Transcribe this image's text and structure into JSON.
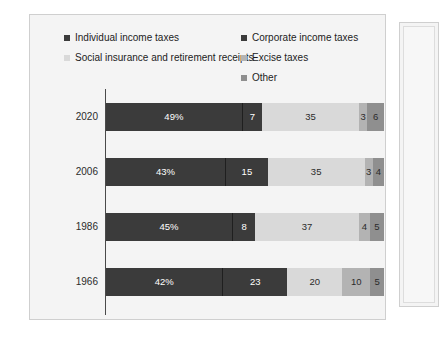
{
  "chart_data": {
    "type": "bar",
    "orientation": "horizontal",
    "stacked": true,
    "title": "",
    "xlabel": "",
    "ylabel": "",
    "categories": [
      "2020",
      "2006",
      "1986",
      "1966"
    ],
    "series": [
      {
        "name": "Individual income taxes",
        "color": "#3b3b3b",
        "label_color": "#ffffff",
        "values": [
          49,
          43,
          45,
          42
        ],
        "labels": [
          "49%",
          "43%",
          "45%",
          "42%"
        ]
      },
      {
        "name": "Corporate income taxes",
        "color": "#3b3b3b",
        "label_color": "#ffffff",
        "values": [
          7,
          15,
          8,
          23
        ],
        "labels": [
          "7",
          "15",
          "8",
          "23"
        ]
      },
      {
        "name": "Social insurance and retirement receipts",
        "color": "#d9d9d9",
        "label_color": "#2b2b2b",
        "values": [
          35,
          35,
          37,
          20
        ],
        "labels": [
          "35",
          "35",
          "37",
          "20"
        ]
      },
      {
        "name": "Excise taxes",
        "color": "#b3b3b3",
        "label_color": "#2b2b2b",
        "values": [
          3,
          3,
          4,
          10
        ],
        "labels": [
          "3",
          "3",
          "4",
          "10"
        ]
      },
      {
        "name": "Other",
        "color": "#8f8f8f",
        "label_color": "#2b2b2b",
        "values": [
          6,
          4,
          5,
          5
        ],
        "labels": [
          "6",
          "4",
          "5",
          "5"
        ]
      }
    ],
    "ylim": [
      0,
      100
    ],
    "grid": false,
    "legend_position": "top"
  },
  "legend": {
    "left_column": [
      {
        "label": "Individual income taxes",
        "color": "#3b3b3b"
      },
      {
        "label": "Social insurance and retirement receipts",
        "color": "#d9d9d9"
      }
    ],
    "right_column": [
      {
        "label": "Corporate income taxes",
        "color": "#3b3b3b"
      },
      {
        "label": "Excise taxes",
        "color": "#b3b3b3"
      },
      {
        "label": "Other",
        "color": "#8f8f8f"
      }
    ]
  },
  "rows": [
    {
      "year": "2020",
      "segments": [
        {
          "name": "Individual income taxes",
          "value": 49,
          "label": "49%",
          "color": "#3b3b3b",
          "text_color": "#ffffff"
        },
        {
          "name": "Corporate income taxes",
          "value": 7,
          "label": "7",
          "color": "#3b3b3b",
          "text_color": "#ffffff"
        },
        {
          "name": "Social insurance and retirement receipts",
          "value": 35,
          "label": "35",
          "color": "#d9d9d9",
          "text_color": "#2b2b2b"
        },
        {
          "name": "Excise taxes",
          "value": 3,
          "label": "3",
          "color": "#b3b3b3",
          "text_color": "#2b2b2b"
        },
        {
          "name": "Other",
          "value": 6,
          "label": "6",
          "color": "#8f8f8f",
          "text_color": "#2b2b2b"
        }
      ]
    },
    {
      "year": "2006",
      "segments": [
        {
          "name": "Individual income taxes",
          "value": 43,
          "label": "43%",
          "color": "#3b3b3b",
          "text_color": "#ffffff"
        },
        {
          "name": "Corporate income taxes",
          "value": 15,
          "label": "15",
          "color": "#3b3b3b",
          "text_color": "#ffffff"
        },
        {
          "name": "Social insurance and retirement receipts",
          "value": 35,
          "label": "35",
          "color": "#d9d9d9",
          "text_color": "#2b2b2b"
        },
        {
          "name": "Excise taxes",
          "value": 3,
          "label": "3",
          "color": "#b3b3b3",
          "text_color": "#2b2b2b"
        },
        {
          "name": "Other",
          "value": 4,
          "label": "4",
          "color": "#8f8f8f",
          "text_color": "#2b2b2b"
        }
      ]
    },
    {
      "year": "1986",
      "segments": [
        {
          "name": "Individual income taxes",
          "value": 45,
          "label": "45%",
          "color": "#3b3b3b",
          "text_color": "#ffffff"
        },
        {
          "name": "Corporate income taxes",
          "value": 8,
          "label": "8",
          "color": "#3b3b3b",
          "text_color": "#ffffff"
        },
        {
          "name": "Social insurance and retirement receipts",
          "value": 37,
          "label": "37",
          "color": "#d9d9d9",
          "text_color": "#2b2b2b"
        },
        {
          "name": "Excise taxes",
          "value": 4,
          "label": "4",
          "color": "#b3b3b3",
          "text_color": "#2b2b2b"
        },
        {
          "name": "Other",
          "value": 5,
          "label": "5",
          "color": "#8f8f8f",
          "text_color": "#2b2b2b"
        }
      ]
    },
    {
      "year": "1966",
      "segments": [
        {
          "name": "Individual income taxes",
          "value": 42,
          "label": "42%",
          "color": "#3b3b3b",
          "text_color": "#ffffff"
        },
        {
          "name": "Corporate income taxes",
          "value": 23,
          "label": "23",
          "color": "#3b3b3b",
          "text_color": "#ffffff"
        },
        {
          "name": "Social insurance and retirement receipts",
          "value": 20,
          "label": "20",
          "color": "#d9d9d9",
          "text_color": "#2b2b2b"
        },
        {
          "name": "Excise taxes",
          "value": 10,
          "label": "10",
          "color": "#b3b3b3",
          "text_color": "#2b2b2b"
        },
        {
          "name": "Other",
          "value": 5,
          "label": "5",
          "color": "#8f8f8f",
          "text_color": "#2b2b2b"
        }
      ]
    }
  ]
}
